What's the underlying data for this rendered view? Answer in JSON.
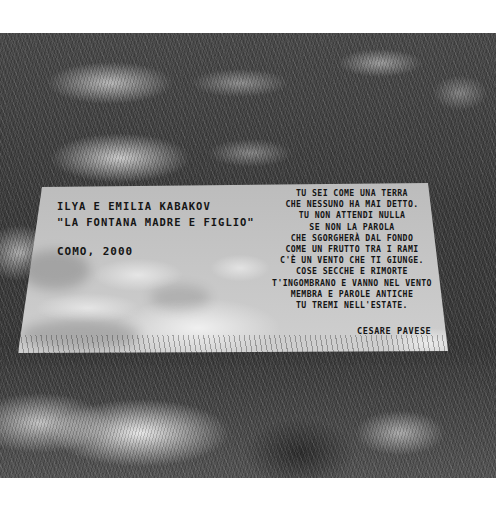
{
  "photo": {
    "description": "Black-and-white photo of a stone plaque lying in grass with dappled tree shadows",
    "colors": {
      "plaque": "#c6c6c6",
      "text": "#151515",
      "grass_dark": "#3c3c3c",
      "border": "#ffffff"
    }
  },
  "plaque": {
    "artists": "ILYA E EMILIA KABAKOV",
    "work_title": "\"LA FONTANA MADRE E FIGLIO\"",
    "place_date": "COMO, 2000",
    "poem_lines": [
      "TU SEI COME UNA TERRA",
      "CHE NESSUNO HA MAI DETTO.",
      "TU NON ATTENDI NULLA",
      "SE NON LA PAROLA",
      "CHE SGORGHERÀ DAL FONDO",
      "COME UN FRUTTO TRA I RAMI",
      "C'È UN VENTO CHE TI GIUNGE.",
      "COSE SECCHE E RIMORTE",
      "T'INGOMBRANO E VANNO NEL VENTO",
      "MEMBRA E PAROLE ANTICHE",
      "TU TREMI NELL'ESTATE."
    ],
    "author": "CESARE PAVESE"
  }
}
